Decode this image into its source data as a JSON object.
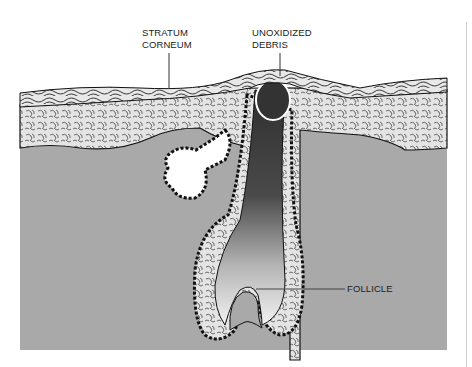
{
  "diagram": {
    "type": "anatomical cross-section",
    "labels": [
      {
        "id": "stratum-corneum",
        "lines": [
          "STRATUM",
          "CORNEUM"
        ]
      },
      {
        "id": "unoxidized-debris",
        "lines": [
          "UNOXIDIZED",
          "DEBRIS"
        ]
      },
      {
        "id": "follicle",
        "lines": [
          "FOLLICLE"
        ]
      }
    ],
    "colors": {
      "dermis": "#a9a9a9",
      "epidermis_fill": "#e6e6e6",
      "cell_border": "#1a1a1a",
      "debris_plug": "#3a3a3a",
      "follicle_lumen": "#f2f2f2",
      "background": "#ffffff"
    }
  }
}
